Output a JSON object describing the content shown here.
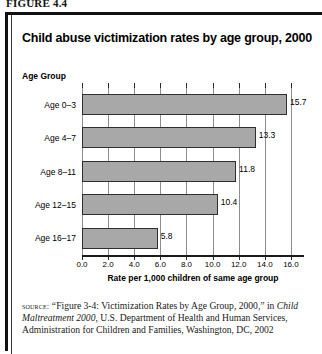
{
  "figure": {
    "label": "FIGURE 4.4"
  },
  "chart_data": {
    "type": "bar",
    "orientation": "horizontal",
    "title": "Child abuse victimization rates by age group, 2000",
    "categories": [
      "Age 0–3",
      "Age 4–7",
      "Age 8–11",
      "Age 12–15",
      "Age 16–17"
    ],
    "values": [
      15.7,
      13.3,
      11.8,
      10.4,
      5.8
    ],
    "value_labels": [
      "15.7",
      "13.3",
      "11.8",
      "10.4",
      "5.8"
    ],
    "xlabel": "Rate per 1,000 children of same age group",
    "ylabel": "Age Group",
    "xlim": [
      0.0,
      17.0
    ],
    "xticks": [
      0.0,
      2.0,
      4.0,
      6.0,
      8.0,
      10.0,
      12.0,
      14.0,
      16.0
    ],
    "xtick_labels": [
      "0.0",
      "2.0",
      "4.0",
      "6.0",
      "8.0",
      "10.0",
      "12.0",
      "14.0",
      "16.0"
    ],
    "grid": true,
    "legend": false,
    "bar_color": "#a8a8a8",
    "bar_edge_color": "#2f2f2f"
  },
  "source": {
    "kicker": "source:",
    "text_before_italic": " “Figure 3-4: Victimization Rates by Age Group, 2000,” in ",
    "italic_title": "Child Maltreatment 2000",
    "text_after_italic": ", U.S. Department of Health and Human Services, Administration for Children and Families, Washington, DC, 2002"
  }
}
